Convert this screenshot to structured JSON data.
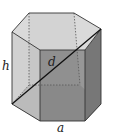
{
  "figure": {
    "type": "hexagonal-prism",
    "labels": {
      "height": "h",
      "diagonal": "d",
      "base_edge": "a"
    },
    "colors": {
      "top_face": "#d4d4d4",
      "left_face": "#c8c8c8",
      "front_face": "#8f8f8f",
      "right_face": "#7a7a7a",
      "inner_back": "#b5b5b5",
      "bottom_face": "#6a6a6a",
      "edge": "#333333",
      "diagonal": "#111111"
    }
  }
}
